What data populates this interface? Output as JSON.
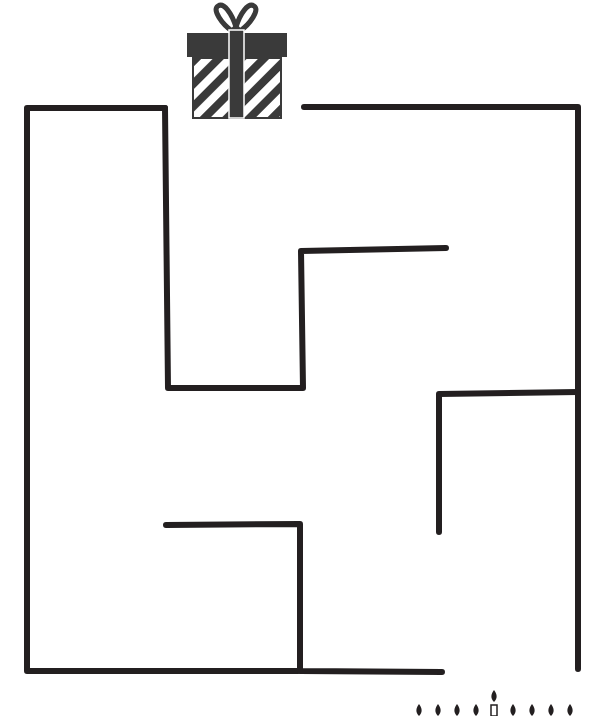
{
  "puzzle": {
    "type": "maze",
    "goal_icon": "gift-box-icon",
    "start_icon": "candles-row-icon",
    "wall_color": "#231f20",
    "background_color": "#ffffff"
  },
  "walls": [
    {
      "id": "outer-left-top",
      "points": "165,108 27,108 27,671 298,671"
    },
    {
      "id": "inner-step",
      "points": "165,108 168,388 303,388 301,251 446,248"
    },
    {
      "id": "top-right",
      "points": "304,107 578,107 578,669"
    },
    {
      "id": "right-hook",
      "points": "578,392 439,394 439,532"
    },
    {
      "id": "lower-hook",
      "points": "166,525 300,524 300,671 442,672"
    }
  ],
  "gift": {
    "x": 187,
    "y": 3,
    "width": 100,
    "height": 115,
    "color": "#3a3a3a"
  },
  "candles": {
    "count_left": 4,
    "count_right": 4,
    "y": 712
  }
}
